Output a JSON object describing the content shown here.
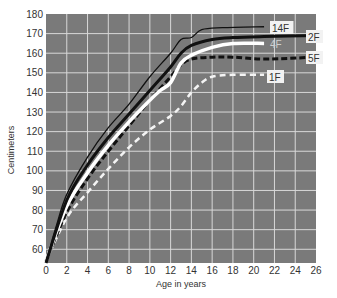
{
  "chart_data": {
    "type": "line",
    "title": "",
    "xlabel": "Age in years",
    "ylabel": "Centimeters",
    "xlim": [
      0,
      26
    ],
    "ylim": [
      53,
      180
    ],
    "grid": true,
    "legend_position": "inline-right-labels",
    "x_ticks": [
      0,
      2,
      4,
      6,
      8,
      10,
      12,
      14,
      16,
      18,
      20,
      22,
      24,
      26
    ],
    "y_ticks": [
      60,
      70,
      80,
      90,
      100,
      110,
      120,
      130,
      140,
      150,
      160,
      170,
      180
    ],
    "colors": {
      "plot_background": "#7a7a7a",
      "grid": "#d8d8d8",
      "label_box": "#f2f2f2"
    },
    "series": [
      {
        "name": "14F",
        "style": "thin-black-solid",
        "x": [
          0,
          1,
          2,
          4,
          6,
          8,
          10,
          12,
          13,
          14,
          15,
          17,
          21
        ],
        "values": [
          54,
          72,
          88,
          107,
          122,
          134,
          148,
          160,
          167,
          168,
          172,
          173,
          173.5
        ]
      },
      {
        "name": "2F",
        "style": "thick-black-solid",
        "x": [
          0,
          2,
          4,
          6,
          8,
          10,
          12,
          13,
          14,
          16,
          18,
          21,
          26
        ],
        "values": [
          53,
          85,
          103,
          117,
          129,
          141,
          153,
          160,
          164,
          167,
          168,
          168.5,
          169
        ]
      },
      {
        "name": "4F",
        "style": "thick-white-solid",
        "x": [
          0,
          2,
          4,
          6,
          8,
          10,
          11,
          12,
          13,
          14,
          16,
          18,
          21
        ],
        "values": [
          54,
          82,
          99,
          113,
          125,
          136,
          141,
          145,
          155,
          159,
          163,
          165,
          165
        ]
      },
      {
        "name": "5F",
        "style": "thick-black-dashed",
        "x": [
          0,
          2,
          4,
          6,
          8,
          10,
          12,
          13,
          14,
          16,
          18,
          21,
          26
        ],
        "values": [
          54,
          79,
          96,
          110,
          123,
          136,
          148,
          154,
          157,
          158,
          158,
          157,
          158
        ]
      },
      {
        "name": "1F",
        "style": "white-dashed",
        "x": [
          0,
          2,
          4,
          6,
          8,
          10,
          12,
          13,
          14,
          15,
          16,
          18,
          21
        ],
        "values": [
          54,
          76,
          89,
          101,
          112,
          121,
          128,
          133,
          140,
          145,
          148,
          149,
          149
        ]
      }
    ]
  }
}
